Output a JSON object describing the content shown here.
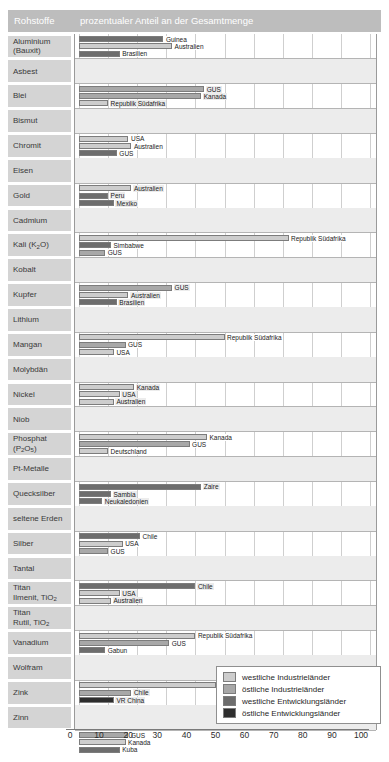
{
  "header": {
    "col_materials": "Rohstoffe",
    "col_share": "prozentualer Anteil an der Gesamtmenge"
  },
  "legend": {
    "items": [
      {
        "label": "westliche Industrieländer",
        "key": "wi",
        "color": "#cdcdcd"
      },
      {
        "label": "östliche Industrieländer",
        "key": "oi",
        "color": "#a8a8a8"
      },
      {
        "label": "westliche Entwicklungsländer",
        "key": "we",
        "color": "#6d6d6d"
      },
      {
        "label": "östliche Entwicklungsländer",
        "key": "oe",
        "color": "#2e2e2e"
      }
    ]
  },
  "axis": {
    "ticks": [
      "0",
      "10",
      "20",
      "30",
      "40",
      "50",
      "60",
      "70",
      "80",
      "90",
      "100"
    ],
    "min": 0,
    "max": 100
  },
  "chart_data": {
    "type": "bar",
    "orientation": "horizontal",
    "title": "prozentualer Anteil an der Gesamtmenge",
    "xlabel": "prozentualer Anteil an der Gesamtmenge",
    "ylabel": "Rohstoffe",
    "xlim": [
      0,
      100
    ],
    "grid": true,
    "legend_position": "bottom-right",
    "categories_legend": [
      "westliche Industrieländer",
      "östliche Industrieländer",
      "westliche Entwicklungsländer",
      "östliche Entwicklungsländer"
    ],
    "rows": [
      {
        "material": "Aluminium (Bauxit)",
        "bars": [
          {
            "label": "Guinea",
            "value": 29,
            "group": "we"
          },
          {
            "label": "Australien",
            "value": 32,
            "group": "wi"
          },
          {
            "label": "Brasilien",
            "value": 14,
            "group": "we"
          }
        ]
      },
      {
        "material": "Asbest",
        "bars": [
          {
            "label": "GUS",
            "value": 43,
            "group": "oi"
          },
          {
            "label": "Kanada",
            "value": 42,
            "group": "oi"
          },
          {
            "label": "Republik Südafrika",
            "value": 10,
            "group": "wi"
          }
        ]
      },
      {
        "material": "Blei",
        "bars": [
          {
            "label": "USA",
            "value": 17,
            "group": "wi"
          },
          {
            "label": "Australien",
            "value": 18,
            "group": "wi"
          },
          {
            "label": "GUS",
            "value": 13,
            "group": "we"
          }
        ]
      },
      {
        "material": "Bismut",
        "bars": [
          {
            "label": "Australien",
            "value": 18,
            "group": "wi"
          },
          {
            "label": "Peru",
            "value": 10,
            "group": "we"
          },
          {
            "label": "Mexiko",
            "value": 12,
            "group": "we"
          }
        ]
      },
      {
        "material": "Chromit",
        "bars": [
          {
            "label": "Republik Südafrika",
            "value": 72,
            "group": "wi"
          },
          {
            "label": "Simbabwe",
            "value": 11,
            "group": "we"
          },
          {
            "label": "GUS",
            "value": 9,
            "group": "oi"
          }
        ]
      },
      {
        "material": "Eisen",
        "bars": [
          {
            "label": "GUS",
            "value": 32,
            "group": "oi"
          },
          {
            "label": "Australien",
            "value": 17,
            "group": "wi"
          },
          {
            "label": "Brasilien",
            "value": 13,
            "group": "we"
          }
        ]
      },
      {
        "material": "Gold",
        "bars": [
          {
            "label": "Republik Südafrika",
            "value": 50,
            "group": "wi"
          },
          {
            "label": "GUS",
            "value": 16,
            "group": "oi"
          },
          {
            "label": "USA",
            "value": 12,
            "group": "wi"
          }
        ]
      },
      {
        "material": "Cadmium",
        "bars": [
          {
            "label": "Kanada",
            "value": 19,
            "group": "wi"
          },
          {
            "label": "USA",
            "value": 14,
            "group": "wi"
          },
          {
            "label": "Australien",
            "value": 12,
            "group": "wi"
          }
        ]
      },
      {
        "material": "Kali (K₂O)",
        "bars": [
          {
            "label": "Kanada",
            "value": 44,
            "group": "wi"
          },
          {
            "label": "GUS",
            "value": 38,
            "group": "oi"
          },
          {
            "label": "Deutschland",
            "value": 10,
            "group": "wi"
          }
        ]
      },
      {
        "material": "Kobalt",
        "bars": [
          {
            "label": "Zaire",
            "value": 42,
            "group": "we"
          },
          {
            "label": "Sambia",
            "value": 11,
            "group": "we"
          },
          {
            "label": "Neukaledonien",
            "value": 8,
            "group": "we"
          }
        ]
      },
      {
        "material": "Kupfer",
        "bars": [
          {
            "label": "Chile",
            "value": 21,
            "group": "we"
          },
          {
            "label": "USA",
            "value": 15,
            "group": "wi"
          },
          {
            "label": "GUS",
            "value": 10,
            "group": "oi"
          }
        ]
      },
      {
        "material": "Lithium",
        "bars": [
          {
            "label": "Chile",
            "value": 40,
            "group": "we"
          },
          {
            "label": "USA",
            "value": 14,
            "group": "wi"
          },
          {
            "label": "Australien",
            "value": 11,
            "group": "wi"
          }
        ]
      },
      {
        "material": "Mangan",
        "bars": [
          {
            "label": "Republik Südafrika",
            "value": 40,
            "group": "wi"
          },
          {
            "label": "GUS",
            "value": 31,
            "group": "oi"
          },
          {
            "label": "Gabun",
            "value": 9,
            "group": "we"
          }
        ]
      },
      {
        "material": "Molybdän",
        "bars": [
          {
            "label": "USA",
            "value": 47,
            "group": "wi"
          },
          {
            "label": "Chile",
            "value": 18,
            "group": "oi"
          },
          {
            "label": "VR China",
            "value": 12,
            "group": "oe"
          }
        ]
      },
      {
        "material": "Nickel",
        "bars": [
          {
            "label": "GUS",
            "value": 17,
            "group": "oi"
          },
          {
            "label": "Kanada",
            "value": 16,
            "group": "wi"
          },
          {
            "label": "Kuba",
            "value": 14,
            "group": "we"
          }
        ]
      },
      {
        "material": "Niob",
        "bars": [
          {
            "label": "Brasilien",
            "value": 78,
            "group": "oe"
          },
          {
            "label": "GUS",
            "value": 13,
            "group": "oi"
          },
          {
            "label": "Kanada",
            "value": 6,
            "group": "wi"
          }
        ]
      },
      {
        "material": "Phosphat (P₂O₅)",
        "bars": [
          {
            "label": "Marokko",
            "value": 50,
            "group": "we"
          },
          {
            "label": "USA",
            "value": 17,
            "group": "wi"
          },
          {
            "label": "GUS",
            "value": 10,
            "group": "oi"
          }
        ]
      },
      {
        "material": "Pt-Metalle",
        "bars": [
          {
            "label": "Republik Südafrika",
            "value": 79,
            "group": "wi"
          },
          {
            "label": "GUS",
            "value": 15,
            "group": "oi"
          },
          {
            "label": "USA",
            "value": 5,
            "group": "wi"
          }
        ]
      },
      {
        "material": "Quecksilber",
        "bars": [
          {
            "label": "Spanien",
            "value": 66,
            "group": "wi"
          },
          {
            "label": "GUS",
            "value": 9,
            "group": "oi"
          },
          {
            "label": "VR China",
            "value": 8,
            "group": "oe"
          }
        ]
      },
      {
        "material": "seltene Erden",
        "bars": [
          {
            "label": "VR China",
            "value": 73,
            "group": "oe"
          },
          {
            "label": "USA",
            "value": 19,
            "group": "wi"
          },
          {
            "label": "Australien",
            "value": 11,
            "group": "wi"
          }
        ]
      },
      {
        "material": "Silber",
        "bars": [
          {
            "label": "GUS",
            "value": 15,
            "group": "oi"
          },
          {
            "label": "Mexiko",
            "value": 14,
            "group": "we"
          },
          {
            "label": "Kanada",
            "value": 13,
            "group": "wi"
          }
        ]
      },
      {
        "material": "Tantal",
        "bars": [
          {
            "label": "Thailand",
            "value": 29,
            "group": "we"
          },
          {
            "label": "Australien",
            "value": 19,
            "group": "wi"
          },
          {
            "label": "GUS",
            "value": 10,
            "group": "oi"
          }
        ]
      },
      {
        "material": "Titan Ilmenit, TiO₂",
        "bars": [
          {
            "label": "Republik Südafrika",
            "value": 18,
            "group": "wi"
          },
          {
            "label": "Norwegen",
            "value": 15,
            "group": "wi"
          },
          {
            "label": "Indien",
            "value": 14,
            "group": "we"
          }
        ]
      },
      {
        "material": "Titan Rutil, TiO₂",
        "bars": [
          {
            "label": "Australien",
            "value": 35,
            "group": "wi"
          },
          {
            "label": "Indien",
            "value": 14,
            "group": "we"
          },
          {
            "label": "Republik Südafrika",
            "value": 15,
            "group": "wi"
          }
        ]
      },
      {
        "material": "Vanadium",
        "bars": [
          {
            "label": "Republik Südafrika",
            "value": 55,
            "group": "wi"
          },
          {
            "label": "GUS",
            "value": 31,
            "group": "oi"
          },
          {
            "label": "VR China",
            "value": 10,
            "group": "oe"
          }
        ]
      },
      {
        "material": "Wolfram",
        "bars": [
          {
            "label": "VR China",
            "value": 44,
            "group": "oe"
          },
          {
            "label": "GUS",
            "value": 13,
            "group": "oi"
          },
          {
            "label": "Kanada",
            "value": 12,
            "group": "wi"
          }
        ]
      },
      {
        "material": "Zink",
        "bars": [
          {
            "label": "Kanada",
            "value": 17,
            "group": "wi"
          },
          {
            "label": "USA",
            "value": 13,
            "group": "wi"
          },
          {
            "label": "Australien",
            "value": 14,
            "group": "wi"
          }
        ]
      },
      {
        "material": "Zinn",
        "bars": [
          {
            "label": "Brasilien",
            "value": 23,
            "group": "we"
          },
          {
            "label": "Malaysia",
            "value": 22,
            "group": "we"
          },
          {
            "label": "Indonesien",
            "value": 15,
            "group": "we"
          }
        ]
      }
    ]
  }
}
